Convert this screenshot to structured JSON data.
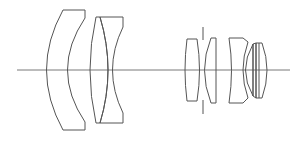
{
  "diagram": {
    "type": "optical-lens-cross-section",
    "colors": {
      "stroke": "#555555",
      "background": "#ffffff"
    },
    "optical_axis": {
      "x1": 17,
      "x2": 290,
      "y": 70
    },
    "aperture_stop": {
      "x": 203,
      "top": [
        27,
        40
      ],
      "bottom": [
        100,
        114
      ]
    },
    "elements": [
      {
        "name": "front-negative-meniscus",
        "group": 1
      },
      {
        "name": "cemented-doublet-front",
        "group": 2
      },
      {
        "name": "rear-positive-element-1",
        "group": 3
      },
      {
        "name": "rear-positive-meniscus",
        "group": 3
      },
      {
        "name": "rear-negative-element",
        "group": 4
      },
      {
        "name": "rear-cemented-doublet",
        "group": 4
      }
    ]
  }
}
